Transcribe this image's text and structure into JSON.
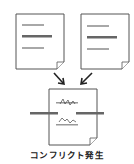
{
  "diagram": {
    "caption": "コンフリクト発生",
    "documents": [
      {
        "id": "left",
        "label": "document-a"
      },
      {
        "id": "right",
        "label": "document-b"
      },
      {
        "id": "merged",
        "label": "conflicted-document"
      }
    ],
    "colors": {
      "page_border": "#555555",
      "line_light": "#a8a8a8",
      "line_dark": "#666666",
      "arrow": "#222222",
      "background": "#ffffff"
    }
  }
}
